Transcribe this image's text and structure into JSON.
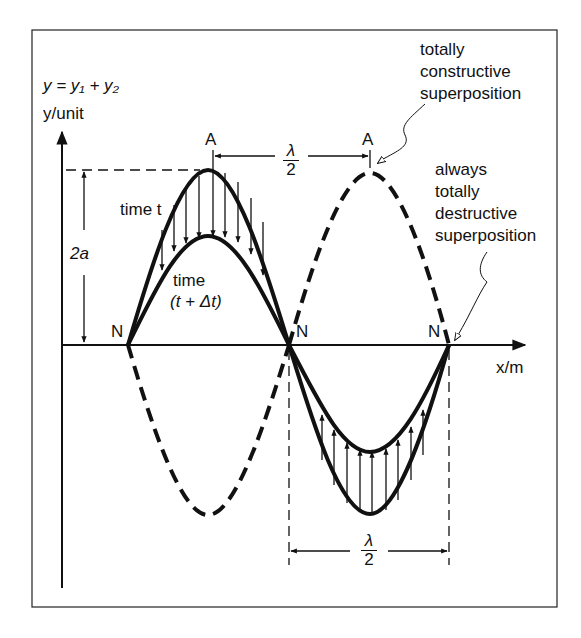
{
  "diagram": {
    "equation": "y = y₁ + y₂",
    "y_axis_label": "y/unit",
    "x_axis_label": "x/m",
    "amplitude_label": "2a",
    "antinode_label": "A",
    "node_label": "N",
    "half_wavelength": {
      "numerator": "λ",
      "denominator": "2"
    },
    "curve_labels": {
      "time_t": "time t",
      "time_later_line1": "time",
      "time_later_line2": "(t + Δt)"
    },
    "annotations": {
      "constructive": [
        "totally",
        "constructive",
        "superposition"
      ],
      "destructive": [
        "always",
        "totally",
        "destructive",
        "superposition"
      ]
    },
    "colors": {
      "ink": "#111111",
      "background": "#ffffff"
    }
  }
}
